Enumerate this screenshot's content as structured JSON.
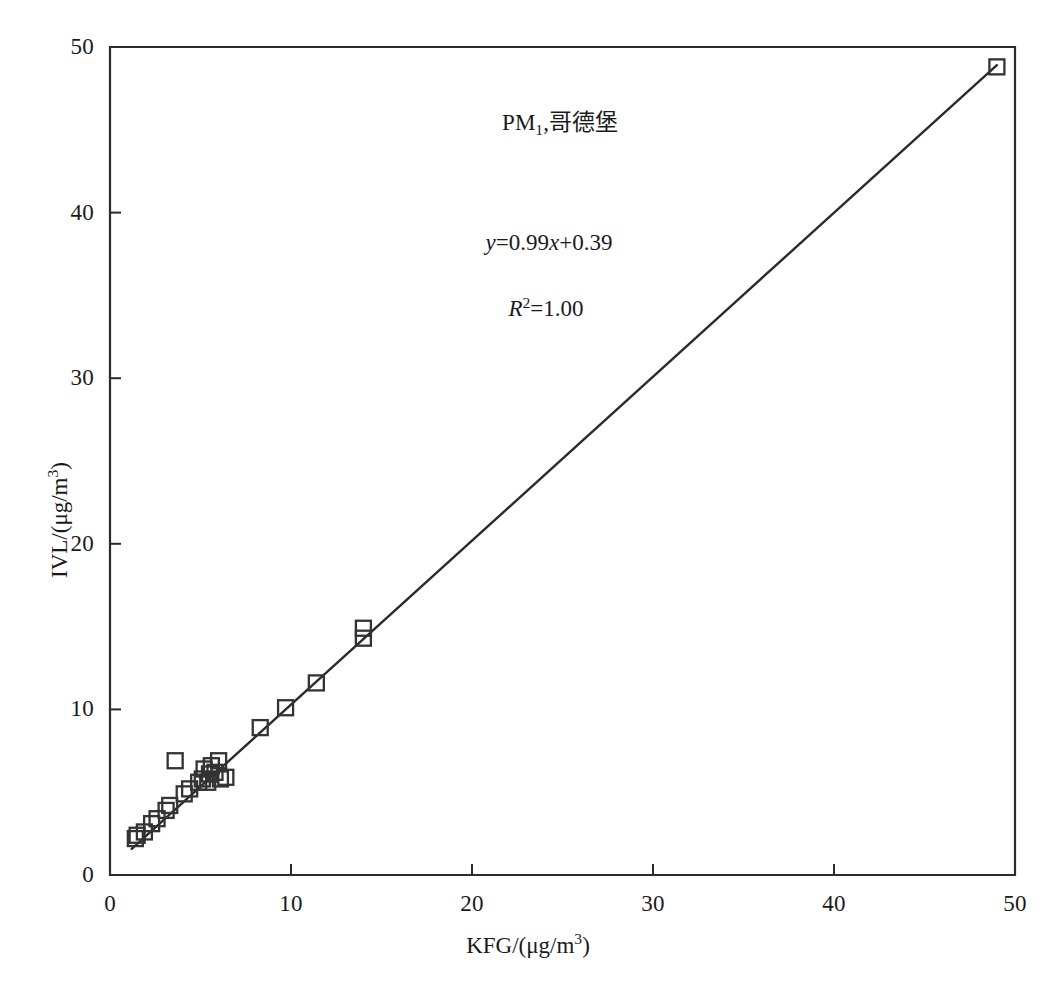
{
  "chart_data": {
    "type": "scatter",
    "title": "",
    "xlabel": "KFG/(μg/m³)",
    "ylabel": "IVL/(μg/m³)",
    "xlim": [
      0,
      50
    ],
    "ylim": [
      0,
      50
    ],
    "xticks": [
      0,
      10,
      20,
      30,
      40,
      50
    ],
    "yticks": [
      0,
      10,
      20,
      30,
      40,
      50
    ],
    "xtick_labels": [
      "0",
      "10",
      "20",
      "30",
      "40",
      "50"
    ],
    "ytick_labels": [
      "0",
      "10",
      "20",
      "30",
      "40",
      "50"
    ],
    "grid": false,
    "legend": false,
    "marker": "open-square",
    "marker_color": "#333333",
    "line_color": "#2b2b2b",
    "series": [
      {
        "name": "PM1 Gothenburg",
        "points": [
          [
            1.4,
            2.2
          ],
          [
            1.5,
            2.4
          ],
          [
            1.9,
            2.6
          ],
          [
            2.3,
            3.1
          ],
          [
            2.6,
            3.4
          ],
          [
            3.1,
            3.9
          ],
          [
            3.3,
            4.2
          ],
          [
            3.6,
            6.9
          ],
          [
            4.1,
            4.9
          ],
          [
            4.4,
            5.2
          ],
          [
            4.9,
            5.6
          ],
          [
            5.1,
            5.8
          ],
          [
            5.2,
            6.4
          ],
          [
            5.4,
            5.6
          ],
          [
            5.5,
            6.1
          ],
          [
            5.6,
            6.6
          ],
          [
            5.8,
            6.2
          ],
          [
            6.0,
            6.9
          ],
          [
            6.1,
            5.8
          ],
          [
            6.4,
            5.9
          ],
          [
            8.3,
            8.9
          ],
          [
            9.7,
            10.1
          ],
          [
            11.4,
            11.6
          ],
          [
            14.0,
            14.3
          ],
          [
            14.0,
            14.9
          ],
          [
            49.0,
            48.8
          ]
        ]
      }
    ],
    "fit_line": {
      "equation": "y=0.99x+0.39",
      "slope": 0.99,
      "intercept": 0.39,
      "r_squared": "1.00",
      "x_start": 1.2,
      "x_end": 49.0
    },
    "annotations": [
      {
        "id": "series_label",
        "text": "PM₁,哥德堡",
        "x": 28,
        "y": 45
      },
      {
        "id": "equation",
        "text": "y=0.99x+0.39",
        "x": 27,
        "y": 38.5
      },
      {
        "id": "r_squared",
        "text": "R²=1.00",
        "x": 27,
        "y": 34.5
      }
    ]
  },
  "labels": {
    "series_name_prefix": "PM",
    "series_name_sub": "1",
    "series_name_rest": ",哥德堡",
    "equation_y": "y",
    "equation_body": "=0.99",
    "equation_x": "x",
    "equation_tail": "+0.39",
    "r2_r": "R",
    "r2_sup": "2",
    "r2_tail": "=1.00",
    "x_axis_title_prefix": "KFG/(μg/m",
    "x_axis_title_sup": "3",
    "x_axis_title_suffix": ")",
    "y_axis_title_prefix": "IVL/(μg/m",
    "y_axis_title_sup": "3",
    "y_axis_title_suffix": ")"
  },
  "axis": {
    "x_tick_labels": [
      "0",
      "10",
      "20",
      "30",
      "40",
      "50"
    ],
    "y_tick_labels": [
      "0",
      "10",
      "20",
      "30",
      "40",
      "50"
    ]
  }
}
